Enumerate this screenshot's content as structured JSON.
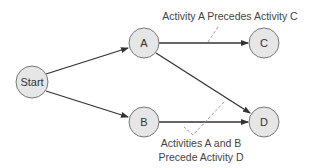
{
  "diagram": {
    "type": "activity-on-node precedence network",
    "colors": {
      "node_fill": "#e6e6e6",
      "node_stroke": "#777777",
      "edge": "#333333",
      "callout": "#999999",
      "text": "#333333"
    },
    "nodes": [
      {
        "id": "start",
        "label": "Start",
        "cx": 32,
        "cy": 82,
        "r": 16
      },
      {
        "id": "a",
        "label": "A",
        "cx": 144,
        "cy": 43,
        "r": 15
      },
      {
        "id": "b",
        "label": "B",
        "cx": 144,
        "cy": 122,
        "r": 15
      },
      {
        "id": "c",
        "label": "C",
        "cx": 264,
        "cy": 43,
        "r": 15
      },
      {
        "id": "d",
        "label": "D",
        "cx": 264,
        "cy": 122,
        "r": 15
      }
    ],
    "edges": [
      {
        "from": "start",
        "to": "a"
      },
      {
        "from": "start",
        "to": "b"
      },
      {
        "from": "a",
        "to": "c"
      },
      {
        "from": "a",
        "to": "d"
      },
      {
        "from": "b",
        "to": "d"
      }
    ],
    "annotations": {
      "top": "Activity A Precedes Activity C",
      "bottom_line1": "Activities A and B",
      "bottom_line2": "Precede Activity D"
    }
  }
}
